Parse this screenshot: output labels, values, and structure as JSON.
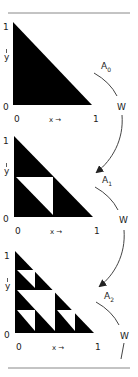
{
  "figure": {
    "colors": {
      "fill": "#000000",
      "line": "#555555",
      "background": "#ffffff",
      "text": "#222222"
    },
    "panels": [
      {
        "id": "A0",
        "set_label": "A",
        "set_index": "0",
        "y_axis": {
          "top": "1",
          "bottom": "0",
          "label": "y"
        },
        "x_axis": {
          "left": "0",
          "right": "1",
          "label": "x →"
        },
        "map_label": "W"
      },
      {
        "id": "A1",
        "set_label": "A",
        "set_index": "1",
        "y_axis": {
          "top": "1",
          "bottom": "0",
          "label": "y"
        },
        "x_axis": {
          "left": "0",
          "right": "1",
          "label": "x →"
        },
        "map_label": "W"
      },
      {
        "id": "A2",
        "set_label": "A",
        "set_index": "2",
        "y_axis": {
          "top": "1",
          "bottom": "0",
          "label": "y"
        },
        "x_axis": {
          "left": "0",
          "right": "1",
          "label": "x →"
        },
        "map_label": "W"
      }
    ]
  }
}
